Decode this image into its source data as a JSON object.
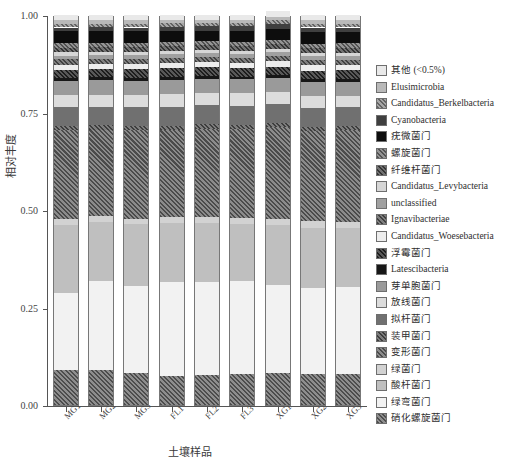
{
  "chart_data": {
    "type": "bar",
    "stacked": true,
    "normalized": true,
    "title": "",
    "xlabel": "土壤样品",
    "ylabel": "相对丰度",
    "ylim": [
      0.0,
      1.0
    ],
    "ytick_labels": [
      "0.00",
      "0.25",
      "0.50",
      "0.75",
      "1.00"
    ],
    "ytick_values": [
      0.0,
      0.25,
      0.5,
      0.75,
      1.0
    ],
    "grid": false,
    "legend_position": "right",
    "categories": [
      "MG1",
      "MG2",
      "MG3",
      "FL1",
      "FL2",
      "FL3",
      "XG1",
      "XG2",
      "XG3"
    ],
    "series": [
      {
        "name": "其他 (<0.5%)",
        "fill": "#e9e9e9",
        "pattern": "solid",
        "values": [
          0.014,
          0.013,
          0.014,
          0.013,
          0.012,
          0.013,
          0.014,
          0.013,
          0.014
        ]
      },
      {
        "name": "Elusimicrobia",
        "fill": "#b9b9b9",
        "pattern": "solid",
        "values": [
          0.009,
          0.009,
          0.009,
          0.008,
          0.008,
          0.008,
          0.009,
          0.009,
          0.009
        ]
      },
      {
        "name": "Candidatus_Berkelbacteria",
        "fill": "#8e8e8e",
        "pattern": "hatch-diag",
        "values": [
          0.009,
          0.009,
          0.009,
          0.009,
          0.009,
          0.009,
          0.01,
          0.01,
          0.01
        ]
      },
      {
        "name": "Cyanobacteria",
        "fill": "#3f3f3f",
        "pattern": "solid",
        "values": [
          0.01,
          0.01,
          0.01,
          0.011,
          0.011,
          0.011,
          0.012,
          0.012,
          0.012
        ]
      },
      {
        "name": "疣微菌门",
        "fill": "#0d0d0d",
        "pattern": "solid",
        "values": [
          0.031,
          0.03,
          0.03,
          0.028,
          0.027,
          0.028,
          0.029,
          0.03,
          0.029
        ]
      },
      {
        "name": "螺旋菌门",
        "fill": "#767676",
        "pattern": "hatch-diag",
        "values": [
          0.011,
          0.011,
          0.011,
          0.011,
          0.01,
          0.011,
          0.011,
          0.011,
          0.011
        ]
      },
      {
        "name": "纤维杆菌门",
        "fill": "#4a4a4a",
        "pattern": "hatch-diag",
        "values": [
          0.012,
          0.012,
          0.012,
          0.012,
          0.012,
          0.012,
          0.013,
          0.013,
          0.013
        ]
      },
      {
        "name": "Candidatus_Levybacteria",
        "fill": "#d6d6d6",
        "pattern": "solid",
        "values": [
          0.008,
          0.008,
          0.008,
          0.008,
          0.008,
          0.008,
          0.008,
          0.008,
          0.008
        ]
      },
      {
        "name": "unclassified",
        "fill": "#a0a0a0",
        "pattern": "solid",
        "values": [
          0.01,
          0.01,
          0.01,
          0.01,
          0.01,
          0.01,
          0.01,
          0.01,
          0.01
        ]
      },
      {
        "name": "Ignavibacteriae",
        "fill": "#5c5c5c",
        "pattern": "hatch-diag",
        "values": [
          0.013,
          0.013,
          0.013,
          0.013,
          0.013,
          0.013,
          0.013,
          0.013,
          0.013
        ]
      },
      {
        "name": "Candidatus_Woesebacteria",
        "fill": "#ededed",
        "pattern": "solid",
        "values": [
          0.013,
          0.013,
          0.013,
          0.014,
          0.014,
          0.014,
          0.014,
          0.014,
          0.014
        ]
      },
      {
        "name": "浮霉菌门",
        "fill": "#2a2a2a",
        "pattern": "hatch-diag",
        "values": [
          0.022,
          0.022,
          0.022,
          0.022,
          0.022,
          0.022,
          0.022,
          0.022,
          0.022
        ]
      },
      {
        "name": "Latescibacteria",
        "fill": "#171717",
        "pattern": "solid",
        "values": [
          0.007,
          0.007,
          0.007,
          0.007,
          0.007,
          0.007,
          0.007,
          0.007,
          0.007
        ]
      },
      {
        "name": "芽单胞菌门",
        "fill": "#9a9a9a",
        "pattern": "solid",
        "values": [
          0.037,
          0.038,
          0.038,
          0.036,
          0.036,
          0.036,
          0.036,
          0.036,
          0.036
        ]
      },
      {
        "name": "放线菌门",
        "fill": "#dcdcdc",
        "pattern": "solid",
        "values": [
          0.031,
          0.03,
          0.031,
          0.034,
          0.033,
          0.033,
          0.03,
          0.03,
          0.03
        ]
      },
      {
        "name": "拟杆菌门",
        "fill": "#707070",
        "pattern": "solid",
        "values": [
          0.048,
          0.048,
          0.047,
          0.048,
          0.048,
          0.048,
          0.048,
          0.048,
          0.048
        ]
      },
      {
        "name": "装甲菌门",
        "fill": "#585858",
        "pattern": "hatch-diag",
        "values": [
          0.011,
          0.011,
          0.011,
          0.011,
          0.011,
          0.011,
          0.011,
          0.011,
          0.011
        ]
      },
      {
        "name": "变形菌门",
        "fill": "#6b6b6b",
        "pattern": "hatch-diag",
        "values": [
          0.228,
          0.222,
          0.227,
          0.224,
          0.228,
          0.227,
          0.236,
          0.232,
          0.234
        ]
      },
      {
        "name": "绿菌门",
        "fill": "#d2d2d2",
        "pattern": "solid",
        "values": [
          0.015,
          0.015,
          0.015,
          0.015,
          0.015,
          0.015,
          0.016,
          0.016,
          0.016
        ]
      },
      {
        "name": "酸杆菌门",
        "fill": "#bfbfbf",
        "pattern": "solid",
        "values": [
          0.175,
          0.152,
          0.158,
          0.15,
          0.15,
          0.148,
          0.152,
          0.155,
          0.152
        ]
      },
      {
        "name": "绿弯菌门",
        "fill": "#f2f2f2",
        "pattern": "solid",
        "values": [
          0.197,
          0.228,
          0.224,
          0.241,
          0.238,
          0.238,
          0.228,
          0.22,
          0.222
        ]
      },
      {
        "name": "硝化螺旋菌门",
        "fill": "#6e6e6e",
        "pattern": "hatch-diag",
        "values": [
          0.089,
          0.089,
          0.081,
          0.075,
          0.078,
          0.079,
          0.081,
          0.08,
          0.08
        ]
      }
    ]
  }
}
